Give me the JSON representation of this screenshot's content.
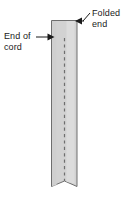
{
  "figure": {
    "background_color": "#ffffff",
    "annotations": [
      {
        "id": "end-of-cord",
        "line1": "End of",
        "line2": "cord",
        "pointer": "arrow-right",
        "target": "left edge of strip near top"
      },
      {
        "id": "folded-end",
        "line1": "Folded",
        "line2": "end",
        "pointer": "arrow-left",
        "target": "top edge of strip"
      }
    ],
    "strip": {
      "fill_color": "#d2d2d2",
      "highlight_color": "#dcdcdc",
      "outline_color": "#6e6e6e",
      "fold_line_style": "dashed",
      "fold_line_color": "#6e6e6e",
      "bottom_edge": "notched"
    },
    "text_color": "#1a1a1a"
  }
}
